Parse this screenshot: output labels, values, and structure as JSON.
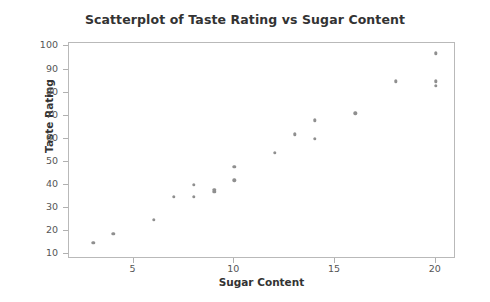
{
  "chart_data": {
    "type": "scatter",
    "title": "Scatterplot of Taste Rating vs Sugar Content",
    "xlabel": "Sugar Content",
    "ylabel": "Taste Rating",
    "xlim": [
      1.8,
      21.0
    ],
    "ylim": [
      8.0,
      101.5
    ],
    "xticks": [
      5,
      10,
      15,
      20
    ],
    "yticks": [
      10,
      20,
      30,
      40,
      50,
      60,
      70,
      80,
      90,
      100
    ],
    "grid": false,
    "legend": null,
    "marker_color": "#8f8f8f",
    "frame_color": "#b9b9b9",
    "x": [
      3,
      4,
      6,
      7,
      8,
      8,
      9,
      9,
      10,
      10,
      12,
      13,
      14,
      14,
      16,
      18,
      20,
      20,
      20
    ],
    "y": [
      15,
      19,
      25,
      35,
      35,
      40,
      37,
      38,
      42,
      48,
      54,
      62,
      60,
      68,
      71,
      85,
      83,
      85,
      97
    ],
    "points": [
      {
        "x": 3,
        "y": 15
      },
      {
        "x": 4,
        "y": 19
      },
      {
        "x": 6,
        "y": 25
      },
      {
        "x": 7,
        "y": 35
      },
      {
        "x": 8,
        "y": 35
      },
      {
        "x": 8,
        "y": 40
      },
      {
        "x": 9,
        "y": 37
      },
      {
        "x": 9,
        "y": 38
      },
      {
        "x": 10,
        "y": 42
      },
      {
        "x": 10,
        "y": 48
      },
      {
        "x": 12,
        "y": 54
      },
      {
        "x": 13,
        "y": 62
      },
      {
        "x": 14,
        "y": 60
      },
      {
        "x": 14,
        "y": 68
      },
      {
        "x": 16,
        "y": 71
      },
      {
        "x": 18,
        "y": 85
      },
      {
        "x": 20,
        "y": 83
      },
      {
        "x": 20,
        "y": 85
      },
      {
        "x": 20,
        "y": 97
      }
    ]
  }
}
